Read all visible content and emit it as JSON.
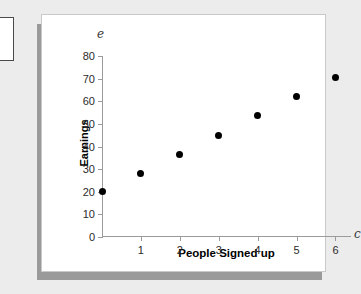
{
  "chart_data": {
    "type": "scatter",
    "title": "",
    "xlabel": "People Signed up",
    "ylabel": "Earnings",
    "x_variable": "c",
    "y_variable": "e",
    "xlim": [
      0,
      6.4
    ],
    "ylim": [
      0,
      80
    ],
    "grid": false,
    "legend": null,
    "x_ticks": [
      1,
      2,
      3,
      4,
      5,
      6
    ],
    "y_ticks": [
      0,
      10,
      20,
      30,
      40,
      50,
      60,
      70,
      80
    ],
    "x_tick_labels": [
      "1",
      "2",
      "3",
      "4",
      "5",
      "6"
    ],
    "y_tick_labels": [
      "0",
      "10",
      "20",
      "30",
      "40",
      "50",
      "60",
      "70",
      "80"
    ],
    "points": [
      {
        "x": 0,
        "y": 20
      },
      {
        "x": 1,
        "y": 28
      },
      {
        "x": 2,
        "y": 36.5
      },
      {
        "x": 3,
        "y": 45
      },
      {
        "x": 4,
        "y": 53.5
      },
      {
        "x": 5,
        "y": 62
      },
      {
        "x": 6,
        "y": 70.5
      }
    ],
    "marker": "filled-circle",
    "marker_color": "#000000"
  },
  "colors": {
    "page_background": "#ececec",
    "card_background": "#ffffff",
    "card_border": "#c9c9c9",
    "card_shadow": "#9a9a9a",
    "axis": "#9b9b9b",
    "text": "#2b2b2b",
    "marker": "#000000"
  }
}
